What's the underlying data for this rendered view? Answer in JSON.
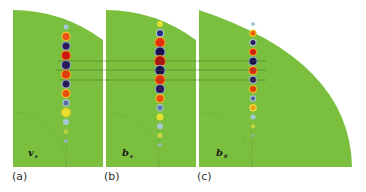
{
  "figure": {
    "panels": [
      {
        "caption": "(a)",
        "variable": "v",
        "subscript": "s",
        "dots": [
          {
            "color": "#a8c8d8",
            "r": 2.5
          },
          {
            "color": "#e8501a",
            "r": 3.5,
            "ring": "#f0c020"
          },
          {
            "color": "#2a1a5a",
            "r": 3.5,
            "ring": "#8aa8c0"
          },
          {
            "color": "#c81a10",
            "r": 4,
            "ring": "#f09020"
          },
          {
            "color": "#2a1a5a",
            "r": 4,
            "ring": "#8aa8c0"
          },
          {
            "color": "#e04010",
            "r": 4,
            "ring": "#f0b020"
          },
          {
            "color": "#2a1a5a",
            "r": 3.5,
            "ring": "#a0b8c8"
          },
          {
            "color": "#e85010",
            "r": 3.5,
            "ring": "#f0c020"
          },
          {
            "color": "#5a6a9a",
            "r": 2.5,
            "ring": "#a8c8d8"
          },
          {
            "color": "#e8e030",
            "r": 3.5,
            "ring": "#f0d020"
          },
          {
            "color": "#a8c8d8",
            "r": 3
          },
          {
            "color": "#b8d040",
            "r": 2.5
          },
          {
            "color": "#98b8b0",
            "r": 2
          }
        ]
      },
      {
        "caption": "(b)",
        "variable": "b",
        "subscript": "s",
        "dots": [
          {
            "color": "#e8e030",
            "r": 3
          },
          {
            "color": "#2a2a7a",
            "r": 3,
            "ring": "#a8c8d8"
          },
          {
            "color": "#e03010",
            "r": 4.5,
            "ring": "#f0a020"
          },
          {
            "color": "#1a1050",
            "r": 4.5,
            "ring": "#8aa8c0"
          },
          {
            "color": "#b01010",
            "r": 5,
            "ring": "#f09020"
          },
          {
            "color": "#1a1050",
            "r": 4.5,
            "ring": "#8aa8c0"
          },
          {
            "color": "#e03010",
            "r": 4.5,
            "ring": "#f0a020"
          },
          {
            "color": "#2a1a5a",
            "r": 4,
            "ring": "#8aa8c0"
          },
          {
            "color": "#e85010",
            "r": 3.5,
            "ring": "#f0c020"
          },
          {
            "color": "#5a7aaa",
            "r": 2.5,
            "ring": "#a8c8d8"
          },
          {
            "color": "#e8e030",
            "r": 3.5
          },
          {
            "color": "#a8c8d8",
            "r": 3
          },
          {
            "color": "#c8d840",
            "r": 2.5
          },
          {
            "color": "#98b8b0",
            "r": 2
          }
        ]
      },
      {
        "caption": "(c)",
        "variable": "b",
        "subscript": "θ",
        "dots": [
          {
            "color": "#a8c8d8",
            "r": 2
          },
          {
            "color": "#e86010",
            "r": 2.5,
            "ring": "#f0d020"
          },
          {
            "color": "#2a1a5a",
            "r": 2.5,
            "ring": "#a8c8d8"
          },
          {
            "color": "#d02010",
            "r": 3,
            "ring": "#f0a020"
          },
          {
            "color": "#1a1050",
            "r": 3.5,
            "ring": "#8aa8c0"
          },
          {
            "color": "#d83010",
            "r": 3.5,
            "ring": "#f0b020"
          },
          {
            "color": "#2a1a5a",
            "r": 3,
            "ring": "#a0b8c8"
          },
          {
            "color": "#e04010",
            "r": 3,
            "ring": "#f0c020"
          },
          {
            "color": "#4a5a8a",
            "r": 2,
            "ring": "#a8c8d8"
          },
          {
            "color": "#e8a020",
            "r": 2.5,
            "ring": "#f0e030"
          },
          {
            "color": "#a8c8d8",
            "r": 2.5
          },
          {
            "color": "#c8d840",
            "r": 2
          },
          {
            "color": "#98b8b0",
            "r": 1.5
          }
        ]
      }
    ],
    "colors": {
      "background": "#7bbf3f",
      "reference_line": "#4a6a2a",
      "dashed_arc": "#5a8a30"
    }
  }
}
